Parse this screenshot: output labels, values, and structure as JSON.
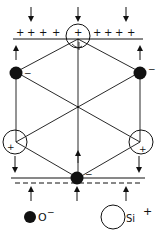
{
  "diagram": {
    "title": "",
    "colors": {
      "ink": "#111111",
      "background": "#ffffff"
    },
    "top_surface": {
      "charge_symbol": "+",
      "left_charges": [
        "+",
        "+",
        "+",
        "+"
      ],
      "center_charge": "+",
      "right_charges": [
        "+",
        "+",
        "+",
        "+"
      ]
    },
    "bottom_surface": {
      "charge_symbol": "-"
    },
    "atoms": [
      {
        "id": "si-top",
        "type": "Si",
        "charge": "+"
      },
      {
        "id": "o-left",
        "type": "O",
        "charge": "−"
      },
      {
        "id": "o-right",
        "type": "O",
        "charge": "−"
      },
      {
        "id": "si-left",
        "type": "Si",
        "charge": "+"
      },
      {
        "id": "si-right",
        "type": "Si",
        "charge": "+"
      },
      {
        "id": "o-bottom",
        "type": "O",
        "charge": "−"
      }
    ],
    "legend": {
      "oxygen": {
        "label": "O",
        "superscript": "−"
      },
      "silicon": {
        "label": "Si",
        "superscript": "+"
      }
    }
  }
}
